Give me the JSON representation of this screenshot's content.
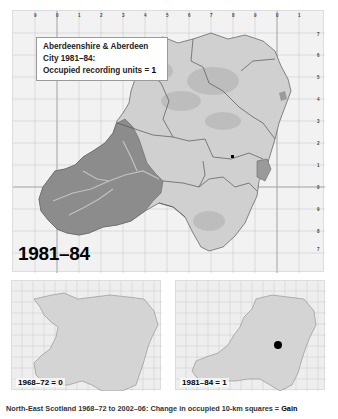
{
  "main_map": {
    "legend": {
      "line1": "Aberdeenshire & Aberdeen",
      "line2": "City 1981–84:",
      "line3_label": "Occupied recording units = ",
      "line3_value": "1"
    },
    "period_label": "1981–84",
    "top_ticks": [
      "9",
      "0",
      "1",
      "2",
      "3",
      "4",
      "5",
      "6",
      "7",
      "8",
      "9",
      "0",
      "1"
    ],
    "right_ticks": [
      "7",
      "6",
      "5",
      "4",
      "3",
      "2",
      "1",
      "0",
      "9",
      "8",
      "7"
    ],
    "record_dots": 1
  },
  "mini_maps": [
    {
      "label": "1968–72 = 0",
      "dots": 0
    },
    {
      "label": "1981–84 = 1",
      "dots": 1
    }
  ],
  "caption": {
    "text": "North-East Scotland 1968–72 to 2002–06: Change in occupied 10-km squares = ",
    "result": "Gain"
  },
  "colors": {
    "lowland": "#cfcfcf",
    "upland": "#8a8a8a",
    "grid": "#c4c4c4",
    "boundary": "#555555",
    "dot": "#000000"
  }
}
